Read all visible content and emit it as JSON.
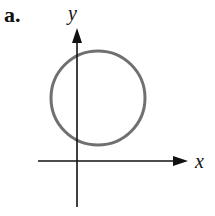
{
  "figure": {
    "part_label": "a.",
    "x_axis_label": "x",
    "y_axis_label": "y",
    "shape": "circle",
    "circle_color": "#707070",
    "axis_color": "#111111"
  }
}
